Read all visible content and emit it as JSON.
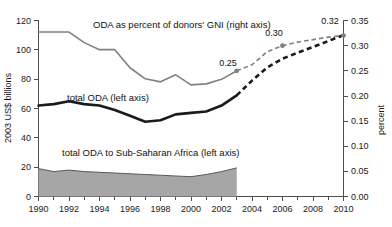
{
  "chart_data": {
    "type": "line",
    "title": "",
    "subtitle": "",
    "xlabel": "",
    "ylabel": "2003 US$ billions",
    "y2label": "percent",
    "xlim": [
      1990,
      2010
    ],
    "ylim": [
      0,
      120
    ],
    "y2lim": [
      0.0,
      0.35
    ],
    "grid": false,
    "legend_position": "inline-annotations",
    "x_ticks": [
      1990,
      1992,
      1994,
      1996,
      1998,
      2000,
      2002,
      2004,
      2006,
      2008,
      2010
    ],
    "x_tick_labels": [
      "1990",
      "1992",
      "1994",
      "1996",
      "1998",
      "2000",
      "2002",
      "2004",
      "2006",
      "2008",
      "2010"
    ],
    "x_minor_ticks": [
      1991,
      1993,
      1995,
      1997,
      1999,
      2001,
      2003,
      2005,
      2007,
      2009
    ],
    "y_ticks": [
      0,
      20,
      40,
      60,
      80,
      100,
      120
    ],
    "y_tick_labels": [
      "0",
      "20",
      "40",
      "60",
      "80",
      "100",
      "120"
    ],
    "y2_ticks": [
      0.0,
      0.05,
      0.1,
      0.15,
      0.2,
      0.25,
      0.3,
      0.35
    ],
    "y2_tick_labels": [
      "0.00",
      "0.05",
      "0.10",
      "0.15",
      "0.20",
      "0.25",
      "0.30",
      "0.35"
    ],
    "series": [
      {
        "name": "ODA as percent of donors' GNI (right axis)",
        "label": "ODA as percent of donors' GNI (right axis)",
        "axis": "right",
        "color": "#808080",
        "style": "solid-then-dashed",
        "x": [
          1990,
          1991,
          1992,
          1993,
          1994,
          1995,
          1996,
          1997,
          1998,
          1999,
          2000,
          2001,
          2002,
          2003,
          2004,
          2005,
          2006,
          2007,
          2008,
          2009,
          2010
        ],
        "values": [
          0.327,
          0.327,
          0.327,
          0.306,
          0.292,
          0.292,
          0.256,
          0.234,
          0.228,
          0.242,
          0.222,
          0.224,
          0.233,
          0.25,
          0.262,
          0.288,
          0.3,
          0.307,
          0.312,
          0.317,
          0.32
        ],
        "dashed_from": 2003,
        "markers": [
          {
            "x": 2003,
            "y": 0.25,
            "label": "0.25"
          },
          {
            "x": 2006,
            "y": 0.3,
            "label": "0.30"
          },
          {
            "x": 2010,
            "y": 0.32,
            "label": "0.32"
          }
        ]
      },
      {
        "name": "total ODA (left axis)",
        "label": "total ODA (left axis)",
        "axis": "left",
        "color": "#1a1a1a",
        "style": "solid-then-dashed",
        "x": [
          1990,
          1991,
          1992,
          1993,
          1994,
          1995,
          1996,
          1997,
          1998,
          1999,
          2000,
          2001,
          2002,
          2003,
          2004,
          2005,
          2006,
          2007,
          2008,
          2009,
          2010
        ],
        "values": [
          62,
          63,
          65,
          63,
          62,
          59,
          55,
          51,
          52,
          56,
          57,
          58,
          62,
          69,
          79,
          88,
          94,
          98,
          102,
          106,
          110
        ],
        "dashed_from": 2003
      },
      {
        "name": "total ODA to Sub-Saharan Africa (left axis)",
        "label": "total ODA to Sub-Saharan Africa (left axis)",
        "axis": "left",
        "color": "#a6a6a6",
        "style": "area",
        "x": [
          1990,
          1991,
          1992,
          1993,
          1994,
          1995,
          1996,
          1997,
          1998,
          1999,
          2000,
          2001,
          2002,
          2003
        ],
        "values": [
          19,
          17,
          18,
          17,
          16.5,
          16,
          15.5,
          15,
          14.5,
          14,
          13.5,
          15,
          17,
          19.5
        ]
      }
    ],
    "annotations": [
      {
        "id": "gni-label",
        "text": "ODA as percent of donors' GNI (right axis)"
      },
      {
        "id": "total-oda-label",
        "text": "total ODA (left axis)"
      },
      {
        "id": "ssa-label",
        "text": "total ODA to Sub-Saharan Africa (left axis)"
      }
    ]
  },
  "axes": {
    "left_title": "2003 US$ billions",
    "right_title": "percent"
  },
  "labels": {
    "y0": "0",
    "y20": "20",
    "y40": "40",
    "y60": "60",
    "y80": "80",
    "y100": "100",
    "y120": "120",
    "r000": "0.00",
    "r005": "0.05",
    "r010": "0.10",
    "r015": "0.15",
    "r020": "0.20",
    "r025": "0.25",
    "r030": "0.30",
    "r035": "0.35",
    "x1990": "1990",
    "x1992": "1992",
    "x1994": "1994",
    "x1996": "1996",
    "x1998": "1998",
    "x2000": "2000",
    "x2002": "2002",
    "x2004": "2004",
    "x2006": "2006",
    "x2008": "2008",
    "x2010": "2010",
    "m025": "0.25",
    "m030": "0.30",
    "m032": "0.32",
    "series_gni": "ODA as percent of donors' GNI (right axis)",
    "series_total": "total ODA (left axis)",
    "series_ssa": "total ODA to Sub-Saharan Africa (left axis)"
  },
  "colors": {
    "gni_line": "#808080",
    "total_line": "#1a1a1a",
    "ssa_fill": "#a6a6a6",
    "ssa_stroke": "#666666",
    "axis": "#4d4d4d",
    "text": "#111111",
    "background": "#ffffff"
  }
}
